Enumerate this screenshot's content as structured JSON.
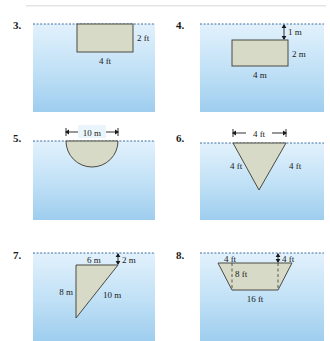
{
  "page": {
    "divider": "horizontal-rule"
  },
  "colors": {
    "shape_fill": "#d7dac6",
    "shape_stroke": "#4a4a42",
    "water_top": "#dff0fb",
    "water_bottom": "#9ecdee",
    "waterline": "#3b6fa0",
    "label_text": "#1a1a1a"
  },
  "problems": [
    {
      "number": "3.",
      "units": "ft",
      "shape": "rectangle",
      "description": "Rectangle with top edge on the water surface",
      "labels": [
        {
          "text": "2 ft",
          "role": "height"
        },
        {
          "text": "4 ft",
          "role": "width"
        }
      ]
    },
    {
      "number": "4.",
      "units": "m",
      "shape": "rectangle",
      "description": "Rectangle submerged 1 m below the water surface",
      "labels": [
        {
          "text": "1 m",
          "role": "depth-to-top"
        },
        {
          "text": "2 m",
          "role": "height"
        },
        {
          "text": "4 m",
          "role": "width"
        }
      ]
    },
    {
      "number": "5.",
      "units": "m",
      "shape": "semicircle",
      "description": "Semicircular plate with flat diameter on the water surface",
      "labels": [
        {
          "text": "10 m",
          "role": "diameter"
        }
      ]
    },
    {
      "number": "6.",
      "units": "ft",
      "shape": "triangle-inverted",
      "description": "Inverted triangle with top edge on the water surface",
      "labels": [
        {
          "text": "4 ft",
          "role": "top-width"
        },
        {
          "text": "4 ft",
          "role": "left-side"
        },
        {
          "text": "4 ft",
          "role": "right-side"
        }
      ]
    },
    {
      "number": "7.",
      "units": "m",
      "shape": "right-triangle",
      "description": "Right triangle submerged 2 m below the water surface",
      "labels": [
        {
          "text": "6 m",
          "role": "top-width"
        },
        {
          "text": "2 m",
          "role": "depth-to-top"
        },
        {
          "text": "8 m",
          "role": "vertical-leg"
        },
        {
          "text": "10 m",
          "role": "hypotenuse"
        }
      ]
    },
    {
      "number": "8.",
      "units": "ft",
      "shape": "trapezoid",
      "description": "Trapezoid with long edge at the water surface, narrowing downward",
      "labels": [
        {
          "text": "4 ft",
          "role": "left-offset"
        },
        {
          "text": "4 ft",
          "role": "right-offset"
        },
        {
          "text": "8 ft",
          "role": "height"
        },
        {
          "text": "16 ft",
          "role": "bottom-width"
        }
      ]
    }
  ]
}
